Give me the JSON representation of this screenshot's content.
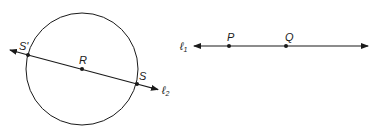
{
  "diagram": {
    "left_figure": {
      "circle": {
        "center_label": "R",
        "cx": 82,
        "cy": 69,
        "r": 56
      },
      "line": {
        "label": "ℓ",
        "label_sub": "2"
      },
      "points": [
        {
          "label": "S'",
          "x": 28,
          "y": 55
        },
        {
          "label": "R",
          "x": 82,
          "y": 69
        },
        {
          "label": "S",
          "x": 137,
          "y": 84
        }
      ]
    },
    "right_figure": {
      "line": {
        "label": "ℓ",
        "label_sub": "1"
      },
      "points": [
        {
          "label": "P",
          "x": 229,
          "y": 46
        },
        {
          "label": "Q",
          "x": 286,
          "y": 46
        }
      ]
    },
    "colors": {
      "stroke": "#1a1a1a",
      "background": "#ffffff"
    }
  }
}
